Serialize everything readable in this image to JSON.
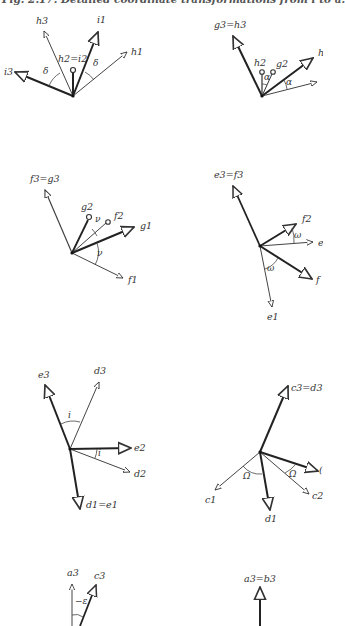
{
  "caption": "Fig. 2.17. Detailed coordinate transformations from i to a.",
  "diagrams": [
    {
      "id": "h-i",
      "angle_symbol": "δ",
      "labels": {
        "h3": "h3",
        "i1": "i1",
        "h2i2": "h2=i2",
        "h1": "h1",
        "i3": "i3"
      },
      "angle_labels": [
        "δ",
        "δ"
      ]
    },
    {
      "id": "g-h",
      "labels": {
        "g3h3": "g3=h3",
        "h2": "h2",
        "g2": "g2",
        "h1": "h"
      },
      "angle_labels": [
        "α",
        "α"
      ]
    },
    {
      "id": "f-g",
      "labels": {
        "f3g3": "f3=g3",
        "g2": "g2",
        "f2": "f2",
        "g1": "g1",
        "f1": "f1"
      },
      "angle_labels": [
        "ν",
        "ν"
      ]
    },
    {
      "id": "e-f",
      "labels": {
        "e3f3": "e3=f3",
        "f2": "f2",
        "e2": "e",
        "f1": "f",
        "e1": "e1"
      },
      "angle_labels": [
        "ω",
        "ω"
      ]
    },
    {
      "id": "d-e",
      "labels": {
        "e3": "e3",
        "d3": "d3",
        "e2": "e2",
        "d2": "d2",
        "d1e1": "d1=e1"
      },
      "angle_labels": [
        "i",
        "i"
      ]
    },
    {
      "id": "c-d",
      "labels": {
        "c3d3": "c3=d3",
        "c1": "c1",
        "c2": "c2",
        "d1": "d1",
        "d2": "("
      },
      "angle_labels": [
        "Ω",
        "Ω"
      ]
    },
    {
      "id": "a-c",
      "labels": {
        "a3": "a3",
        "c3": "c3"
      },
      "angle_labels": [
        "−ε"
      ]
    },
    {
      "id": "a-b",
      "labels": {
        "a3b3": "a3=b3"
      }
    }
  ]
}
